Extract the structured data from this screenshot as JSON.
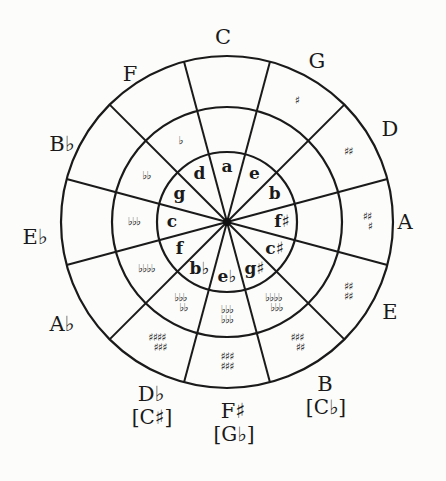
{
  "diagram": {
    "geometry": {
      "cx": 227,
      "cy": 222,
      "r_outer": 166,
      "r_middle": 115,
      "r_inner": 70,
      "spoke_offset_deg": 15
    },
    "colors": {
      "ink": "#1a1a1a",
      "paper": "#fcfcfa"
    },
    "sectors": [
      {
        "major": "C",
        "enharmonic": "",
        "minor": "a",
        "signature": [],
        "sig_ring": "none",
        "label_pos": [
          223,
          38
        ]
      },
      {
        "major": "G",
        "enharmonic": "",
        "minor": "e",
        "signature": [
          "♯"
        ],
        "sig_ring": "outer",
        "label_pos": [
          317,
          62
        ]
      },
      {
        "major": "D",
        "enharmonic": "",
        "minor": "b",
        "signature": [
          "♯♯"
        ],
        "sig_ring": "outer",
        "label_pos": [
          390,
          130
        ]
      },
      {
        "major": "A",
        "enharmonic": "",
        "minor": "f♯",
        "signature": [
          "♯♯",
          "♯"
        ],
        "sig_ring": "outer",
        "label_pos": [
          405,
          223
        ]
      },
      {
        "major": "E",
        "enharmonic": "",
        "minor": "c♯",
        "signature": [
          "♯♯",
          "♯♯"
        ],
        "sig_ring": "outer",
        "label_pos": [
          390,
          313
        ]
      },
      {
        "major": "B",
        "enharmonic": "[C♭]",
        "minor": "g♯",
        "signature": [
          "♯♯♯",
          "♯♯"
        ],
        "sig_ring": "outer",
        "label_pos": [
          325,
          385
        ]
      },
      {
        "major": "F♯",
        "enharmonic": "[G♭]",
        "minor": "e♭",
        "signature": [
          "♯♯♯",
          "♯♯♯"
        ],
        "sig_ring": "outer",
        "label_pos": [
          233,
          412
        ]
      },
      {
        "major": "D♭",
        "enharmonic": "[C♯]",
        "minor": "b♭",
        "signature": [
          "♯♯♯♯",
          "♯♯♯"
        ],
        "sig_ring": "outer",
        "label_pos": [
          151,
          395
        ]
      },
      {
        "major": "A♭",
        "enharmonic": "",
        "minor": "f",
        "signature": [
          "♭♭♭♭"
        ],
        "sig_ring": "middle",
        "label_pos": [
          62,
          325
        ]
      },
      {
        "major": "E♭",
        "enharmonic": "",
        "minor": "c",
        "signature": [
          "♭♭♭"
        ],
        "sig_ring": "middle",
        "label_pos": [
          35,
          238
        ]
      },
      {
        "major": "B♭",
        "enharmonic": "",
        "minor": "g",
        "signature": [
          "♭♭"
        ],
        "sig_ring": "middle",
        "label_pos": [
          62,
          145
        ]
      },
      {
        "major": "F",
        "enharmonic": "",
        "minor": "d",
        "signature": [
          "♭"
        ],
        "sig_ring": "middle",
        "label_pos": [
          130,
          75
        ]
      }
    ],
    "middle_ring_flats": [
      {
        "index": 5,
        "signature": [
          "♭♭♭♭",
          "♭♭♭"
        ]
      },
      {
        "index": 6,
        "signature": [
          "♭♭♭",
          "♭♭♭"
        ]
      },
      {
        "index": 7,
        "signature": [
          "♭♭♭",
          "♭♭"
        ]
      }
    ]
  }
}
